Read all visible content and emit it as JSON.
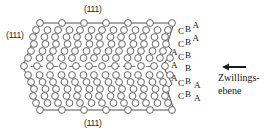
{
  "figure": {
    "type": "crystal-lattice-diagram",
    "background_color": "#ffffff",
    "line_color": "#3a3a3a",
    "atom_outline_color": "#4a4a4a",
    "atom_fill_color": "#ffffff",
    "text_color": "#1a1a1a"
  },
  "plane_labels": {
    "top": "(111)",
    "left": "(111)",
    "bottom": "(111)"
  },
  "annotation": {
    "arrow": "left-arrow",
    "caption": "Zwillings-\nebene"
  },
  "stacking_sequence": {
    "description": "Close-packed stacking letters read top to bottom; mirror plane at the middle B row",
    "rows": [
      {
        "left": "C",
        "middle": "B",
        "right": "A"
      },
      {
        "left": "C",
        "middle": "B",
        "right": "A"
      },
      {
        "far_left": "A",
        "left": "C",
        "middle": "B",
        "right": ""
      },
      {
        "far_left": "A",
        "left": "",
        "middle": "B",
        "right": ""
      },
      {
        "far_left": "A",
        "left": "C",
        "middle": "B",
        "right": "A"
      },
      {
        "left": "C",
        "middle": "B",
        "right": "A"
      },
      {
        "left": "",
        "middle": "",
        "right": "A"
      }
    ],
    "letters": [
      "A",
      "B",
      "C"
    ]
  },
  "lattice": {
    "atom_rows_upper": 7,
    "atom_rows_lower": 7,
    "twin_plane": "horizontal dashed line through the centre",
    "atom_shape": "open-circle"
  }
}
